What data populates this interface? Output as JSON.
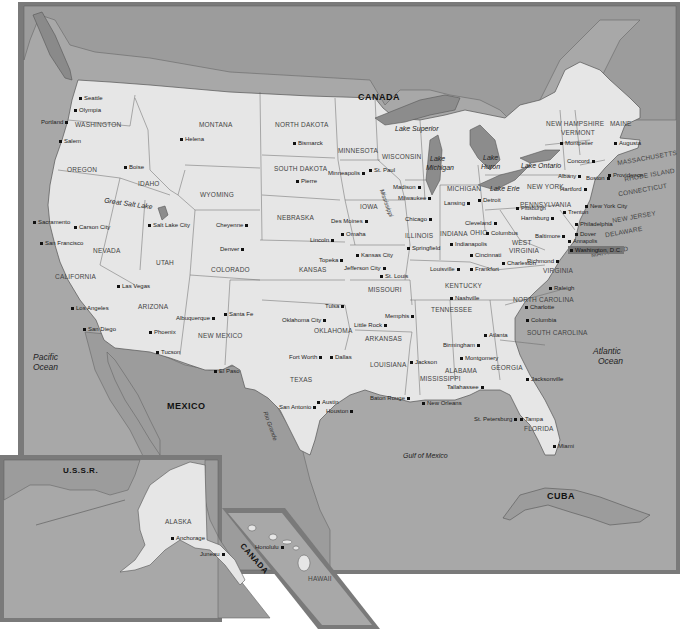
{
  "map": {
    "title": "United States",
    "colors": {
      "land_us": "#e6e6e6",
      "land_foreign": "#9a9a9a",
      "water": "#a6a6a6",
      "lakes": "#8c8c8c",
      "frame": "#7a7a7a",
      "border": "#555555"
    },
    "countries": {
      "canada": "CANADA",
      "mexico": "MEXICO",
      "cuba": "CUBA",
      "ussr": "U.S.S.R.",
      "canada_inset": "CANADA"
    },
    "water_bodies": {
      "pacific": "Pacific Ocean",
      "pacific_l1": "Pacific",
      "pacific_l2": "Ocean",
      "atlantic_l1": "Atlantic",
      "atlantic_l2": "Ocean",
      "gulf": "Gulf of Mexico",
      "great_salt_lake": "Great Salt Lake",
      "lake_superior": "Lake Superior",
      "lake_michigan_l1": "Lake",
      "lake_michigan_l2": "Michigan",
      "lake_huron_l1": "Lake",
      "lake_huron_l2": "Huron",
      "lake_erie": "Lake Erie",
      "lake_ontario": "Lake Ontario",
      "mississippi": "Mississippi",
      "rio_grande": "Rio Grande"
    },
    "states": {
      "washington": "WASHINGTON",
      "oregon": "OREGON",
      "california": "CALIFORNIA",
      "nevada": "NEVADA",
      "idaho": "IDAHO",
      "montana": "MONTANA",
      "wyoming": "WYOMING",
      "utah": "UTAH",
      "arizona": "ARIZONA",
      "colorado": "COLORADO",
      "new_mexico": "NEW MEXICO",
      "north_dakota": "NORTH DAKOTA",
      "south_dakota": "SOUTH DAKOTA",
      "nebraska": "NEBRASKA",
      "kansas": "KANSAS",
      "oklahoma": "OKLAHOMA",
      "texas": "TEXAS",
      "minnesota": "MINNESOTA",
      "iowa": "IOWA",
      "missouri": "MISSOURI",
      "arkansas": "ARKANSAS",
      "louisiana": "LOUISIANA",
      "wisconsin": "WISCONSIN",
      "illinois": "ILLINOIS",
      "michigan": "MICHIGAN",
      "indiana": "INDIANA",
      "ohio": "OHIO",
      "kentucky": "KENTUCKY",
      "tennessee": "TENNESSEE",
      "mississippi": "MISSISSIPPI",
      "alabama": "ALABAMA",
      "georgia": "GEORGIA",
      "florida": "FLORIDA",
      "south_carolina": "SOUTH CAROLINA",
      "north_carolina": "NORTH CAROLINA",
      "virginia": "VIRGINIA",
      "west_virginia_l1": "WEST",
      "west_virginia_l2": "VIRGINIA",
      "pennsylvania": "PENNSYLVANIA",
      "new_york": "NEW YORK",
      "vermont": "VERMONT",
      "new_hampshire": "NEW HAMPSHIRE",
      "maine": "MAINE",
      "massachusetts": "MASSACHUSETTS",
      "rhode_island": "RHODE ISLAND",
      "connecticut": "CONNECTICUT",
      "new_jersey": "NEW JERSEY",
      "delaware": "DELAWARE",
      "maryland": "MARYLAND",
      "alaska": "ALASKA",
      "hawaii": "HAWAII"
    },
    "cities": {
      "seattle": "Seattle",
      "olympia": "Olympia",
      "portland": "Portland",
      "salem": "Salem",
      "boise": "Boise",
      "helena": "Helena",
      "bismarck": "Bismarck",
      "pierre": "Pierre",
      "cheyenne": "Cheyenne",
      "salt_lake_city": "Salt Lake City",
      "carson_city": "Carson City",
      "sacramento": "Sacramento",
      "san_francisco": "San Francisco",
      "los_angeles": "Los Angeles",
      "san_diego": "San Diego",
      "las_vegas": "Las Vegas",
      "phoenix": "Phoenix",
      "tucson": "Tucson",
      "albuquerque": "Albuquerque",
      "santa_fe": "Santa Fe",
      "el_paso": "El Paso",
      "denver": "Denver",
      "lincoln": "Lincoln",
      "omaha": "Omaha",
      "des_moines": "Des Moines",
      "topeka": "Topeka",
      "kansas_city": "Kansas City",
      "jefferson_city": "Jefferson City",
      "st_louis": "St. Louis",
      "minneapolis": "Minneapolis",
      "st_paul": "St. Paul",
      "madison": "Madison",
      "milwaukee": "Milwaukee",
      "chicago": "Chicago",
      "springfield": "Springfield",
      "lansing": "Lansing",
      "detroit": "Detroit",
      "indianapolis": "Indianapolis",
      "cleveland": "Cleveland",
      "columbus": "Columbus",
      "cincinnati": "Cincinnati",
      "louisville": "Louisville",
      "frankfort": "Frankfort",
      "charleston": "Charleston",
      "nashville": "Nashville",
      "memphis": "Memphis",
      "tulsa": "Tulsa",
      "oklahoma_city": "Oklahoma City",
      "little_rock": "Little Rock",
      "fort_worth": "Fort Worth",
      "dallas": "Dallas",
      "austin": "Austin",
      "san_antonio": "San Antonio",
      "houston": "Houston",
      "baton_rouge": "Baton Rouge",
      "new_orleans": "New Orleans",
      "jackson": "Jackson",
      "birmingham": "Birmingham",
      "montgomery": "Montgomery",
      "atlanta": "Atlanta",
      "tallahassee": "Tallahassee",
      "jacksonville": "Jacksonville",
      "tampa": "Tampa",
      "st_petersburg": "St. Petersburg",
      "miami": "Miami",
      "columbia": "Columbia",
      "charlotte": "Charlotte",
      "raleigh": "Raleigh",
      "richmond": "Richmond",
      "washington_dc": "Washington, D.C.",
      "annapolis": "Annapolis",
      "baltimore": "Baltimore",
      "dover": "Dover",
      "philadelphia": "Philadelphia",
      "trenton": "Trenton",
      "harrisburg": "Harrisburg",
      "pittsburgh": "Pittsburgh",
      "new_york_city": "New York City",
      "hartford": "Hartford",
      "providence": "Providence",
      "boston": "Boston",
      "albany": "Albany",
      "concord": "Concord",
      "montpelier": "Montpelier",
      "augusta": "Augusta",
      "anchorage": "Anchorage",
      "juneau": "Juneau",
      "honolulu": "Honolulu"
    }
  }
}
